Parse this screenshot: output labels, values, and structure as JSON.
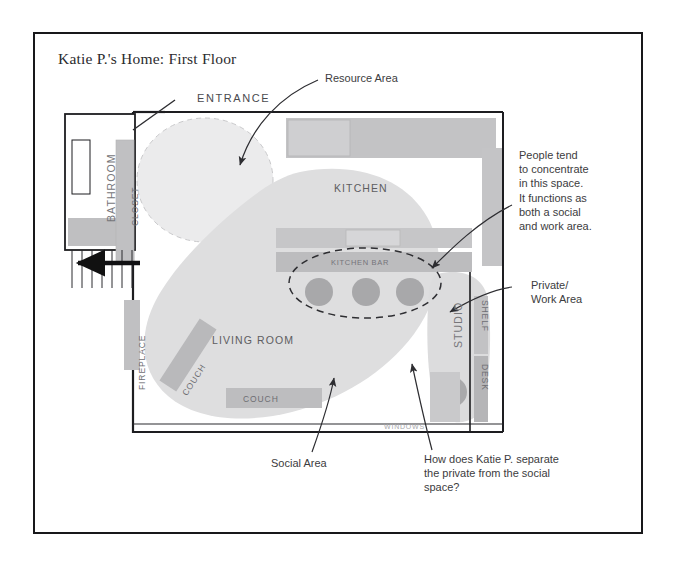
{
  "document": {
    "title": "Katie P.'s Home: First Floor"
  },
  "plan": {
    "entrance_label": "ENTRANCE",
    "windows_label": "WINDOWS",
    "rooms": [
      {
        "id": "bathroom",
        "label": "BATHROOM"
      },
      {
        "id": "closet",
        "label": "CLOSET"
      },
      {
        "id": "kitchen",
        "label": "KITCHEN"
      },
      {
        "id": "living-room",
        "label": "LIVING ROOM"
      },
      {
        "id": "studio",
        "label": "STUDIO"
      }
    ],
    "furniture": [
      {
        "id": "fireplace",
        "label": "FIREPLACE"
      },
      {
        "id": "couch-angled",
        "label": "COUCH"
      },
      {
        "id": "couch-lower",
        "label": "COUCH"
      },
      {
        "id": "kitchen-bar",
        "label": "KITCHEN BAR"
      },
      {
        "id": "shelf",
        "label": "SHELF"
      },
      {
        "id": "desk",
        "label": "DESK"
      }
    ],
    "stool_count": 3
  },
  "annotations": [
    {
      "id": "resource-area",
      "text": "Resource Area"
    },
    {
      "id": "people-concentrate",
      "text": "People tend\nto concentrate\nin this space.\nIt functions as\nboth a social\nand work area."
    },
    {
      "id": "private-work-area",
      "text": "Private/\nWork Area"
    },
    {
      "id": "social-area",
      "text": "Social Area"
    },
    {
      "id": "separation-question",
      "text": "How does Katie P. separate\nthe private from the social\nspace?"
    }
  ],
  "colors": {
    "frame": "#18181a",
    "wall": "#1d1d20",
    "furniture_fill": "#b9b9bb",
    "zone_social": "#dededf",
    "zone_resource": "#e9e9ea",
    "stool_fill": "#a8a8aa",
    "text": "#3c3c40"
  }
}
